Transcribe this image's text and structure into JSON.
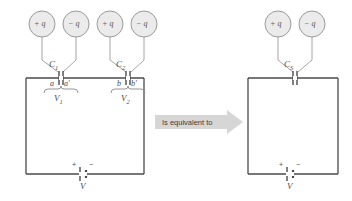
{
  "figure": {
    "background_color": "#ffffff",
    "wire_color": "#4a4a4a",
    "circle_fill": "#ebebeb",
    "circle_stroke": "#9a9a9a",
    "arrow_fill": "#d6d6d6",
    "brace_color": "#8a8a8a"
  },
  "left_circuit": {
    "charges": [
      {
        "label": "+ q",
        "name": "charge-plus-q-c1"
      },
      {
        "label": "− q",
        "name": "charge-minus-q-c1"
      },
      {
        "label": "+ q",
        "name": "charge-plus-q-c2"
      },
      {
        "label": "− q",
        "name": "charge-minus-q-c2"
      }
    ],
    "capacitor1": {
      "label": "C",
      "subscript": "1",
      "plate_left": "a",
      "plate_right": "a′",
      "voltage": "V",
      "voltage_subscript": "1"
    },
    "capacitor2": {
      "label": "C",
      "subscript": "2",
      "plate_left": "b",
      "plate_right": "b′",
      "voltage": "V",
      "voltage_subscript": "2"
    },
    "battery": {
      "plus": "+",
      "minus": "−",
      "label": "V"
    }
  },
  "equivalence": {
    "text": "Is equivalent to"
  },
  "right_circuit": {
    "charges": [
      {
        "label": "+ q",
        "name": "charge-plus-q-cs"
      },
      {
        "label": "− q",
        "name": "charge-minus-q-cs"
      }
    ],
    "capacitor": {
      "label": "C",
      "subscript": "S"
    },
    "battery": {
      "plus": "+",
      "minus": "−",
      "label": "V"
    }
  }
}
